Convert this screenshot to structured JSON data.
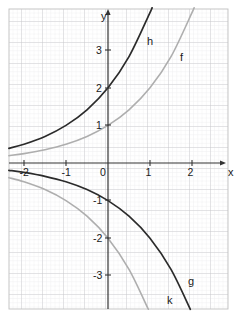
{
  "figure": {
    "type": "coordinate-grid-plot",
    "background": "#ffffff",
    "frame": {
      "x": 9,
      "y": 9,
      "width": 219,
      "height": 300,
      "border_color": "#c0c0c0"
    },
    "grid": {
      "minor_color": "#e9e9ec",
      "major_color": "#c6c6cc",
      "minor_step_px": 4.2,
      "major_step_px": 21,
      "visible": true
    }
  },
  "axes": {
    "x_axis": {
      "label": "x",
      "label_pos": {
        "x": 228,
        "y": 176
      },
      "color": "#333333",
      "arrow": true,
      "y_px": 163,
      "ticks": [
        {
          "value": -2,
          "label": "-2",
          "x_px": 24
        },
        {
          "value": -1,
          "label": "-1",
          "x_px": 66
        },
        {
          "value": 0,
          "label": "0",
          "x_px": 108
        },
        {
          "value": 1,
          "label": "1",
          "x_px": 150
        },
        {
          "value": 2,
          "label": "2",
          "x_px": 192
        }
      ]
    },
    "y_axis": {
      "label": "y",
      "label_pos": {
        "x": 101,
        "y": 20
      },
      "color": "#333333",
      "arrow": true,
      "x_px": 108,
      "ticks": [
        {
          "value": 3,
          "label": "3",
          "y_px": 50
        },
        {
          "value": 2,
          "label": "2",
          "y_px": 88
        },
        {
          "value": 1,
          "label": "1",
          "y_px": 125
        },
        {
          "value": -1,
          "label": "-1",
          "y_px": 200
        },
        {
          "value": -2,
          "label": "-2",
          "y_px": 238
        },
        {
          "value": -3,
          "label": "-3",
          "y_px": 275
        }
      ]
    },
    "origin_px": {
      "x": 108,
      "y": 163
    },
    "unit_px": {
      "x": 42,
      "y": 37.6
    }
  },
  "chart_data": {
    "type": "line",
    "title": "",
    "xlabel": "x",
    "ylabel": "y",
    "xlim": [
      -2.36,
      2.86
    ],
    "ylim": [
      -3.89,
      4.1
    ],
    "grid": true,
    "legend": "inline-curve-labels",
    "series": [
      {
        "name": "f",
        "label": "f",
        "expression": "2^x",
        "color": "#aeaeae",
        "stroke_width": 1.6,
        "label_pos": {
          "x": 180,
          "y": 61
        },
        "y_intercept": 1,
        "points": [
          [
            -2.36,
            0.195
          ],
          [
            -2.0,
            0.25
          ],
          [
            -1.5,
            0.354
          ],
          [
            -1.0,
            0.5
          ],
          [
            -0.5,
            0.707
          ],
          [
            0.0,
            1.0
          ],
          [
            0.5,
            1.414
          ],
          [
            1.0,
            2.0
          ],
          [
            1.5,
            2.828
          ],
          [
            2.0,
            4.0
          ],
          [
            2.04,
            4.11
          ]
        ]
      },
      {
        "name": "h",
        "label": "h",
        "expression": "2 * 2^x",
        "color": "#2b2b2b",
        "stroke_width": 1.7,
        "label_pos": {
          "x": 147,
          "y": 45
        },
        "y_intercept": 2,
        "points": [
          [
            -2.36,
            0.39
          ],
          [
            -2.0,
            0.5
          ],
          [
            -1.5,
            0.707
          ],
          [
            -1.0,
            1.0
          ],
          [
            -0.5,
            1.414
          ],
          [
            0.0,
            2.0
          ],
          [
            0.5,
            2.828
          ],
          [
            1.0,
            4.0
          ],
          [
            1.04,
            4.11
          ]
        ]
      },
      {
        "name": "g",
        "label": "g",
        "expression": "-(2^x)",
        "color": "#2b2b2b",
        "stroke_width": 1.7,
        "label_pos": {
          "x": 188,
          "y": 285
        },
        "y_intercept": -1,
        "points": [
          [
            -2.36,
            -0.195
          ],
          [
            -2.0,
            -0.25
          ],
          [
            -1.5,
            -0.354
          ],
          [
            -1.0,
            -0.5
          ],
          [
            -0.5,
            -0.707
          ],
          [
            0.0,
            -1.0
          ],
          [
            0.5,
            -1.414
          ],
          [
            1.0,
            -2.0
          ],
          [
            1.5,
            -2.828
          ],
          [
            1.96,
            -3.89
          ]
        ]
      },
      {
        "name": "k",
        "label": "k",
        "expression": "-2 * 2^x",
        "color": "#aeaeae",
        "stroke_width": 1.6,
        "label_pos": {
          "x": 167,
          "y": 304
        },
        "y_intercept": -2,
        "points": [
          [
            -2.36,
            -0.39
          ],
          [
            -2.0,
            -0.5
          ],
          [
            -1.5,
            -0.707
          ],
          [
            -1.0,
            -1.0
          ],
          [
            -0.5,
            -1.414
          ],
          [
            0.0,
            -2.0
          ],
          [
            0.5,
            -2.828
          ],
          [
            0.96,
            -3.89
          ]
        ]
      }
    ]
  }
}
